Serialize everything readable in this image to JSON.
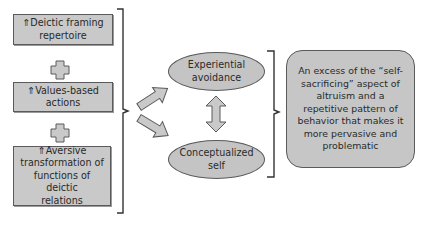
{
  "diagram": {
    "left_boxes": [
      {
        "arrow": "⇑",
        "text": "Deictic framing repertoire",
        "line1": "Deictic framing",
        "line2": "repertoire"
      },
      {
        "arrow": "⇑",
        "text": "Values-based actions",
        "line1": "Values-based",
        "line2": "actions"
      },
      {
        "arrow": "⇑",
        "text": "Aversive transformation of functions of deictic relations",
        "line1": "Aversive",
        "line2": "transformation of",
        "line3": "functions of deictic",
        "line4": "relations"
      }
    ],
    "connectors": {
      "between_left_boxes": "plus-icon",
      "left_to_middle": "brace-with-two-arrows",
      "between_ellipses": "double-arrow",
      "middle_to_right": "brace"
    },
    "ellipses": [
      {
        "line1": "Experiential",
        "line2": "avoidance"
      },
      {
        "line1": "Conceptualized",
        "line2": "self"
      }
    ],
    "outcome_box": {
      "lines": [
        "An excess of the “self-",
        "sacrificing” aspect of",
        "altruism and a",
        "repetitive pattern of",
        "behavior that makes it",
        "more pervasive and",
        "problematic"
      ]
    },
    "colors": {
      "box_fill": "#c9c9c9",
      "border": "#5a5a5a",
      "background": "#ffffff"
    }
  }
}
